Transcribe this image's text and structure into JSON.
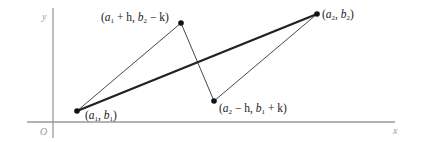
{
  "diagram": {
    "axes": {
      "origin_label": "O",
      "x_label": "x",
      "y_label": "y"
    },
    "points": [
      {
        "id": "p1",
        "name": "a",
        "sub": "1",
        "label_parts": [
          "(",
          "a",
          "1",
          ", ",
          "b",
          "1",
          ")"
        ],
        "x": 77,
        "y": 111
      },
      {
        "id": "p2",
        "label_parts": [
          "(",
          "a",
          "1",
          " + h, ",
          "b",
          "2",
          " − k)"
        ],
        "x": 181,
        "y": 23
      },
      {
        "id": "p3",
        "label_parts": [
          "(",
          "a",
          "2",
          ", ",
          "b",
          "2",
          ")"
        ],
        "x": 317,
        "y": 14
      },
      {
        "id": "p4",
        "label_parts": [
          "(",
          "a",
          "2",
          " − h, ",
          "b",
          "1",
          " + k)"
        ],
        "x": 214,
        "y": 101
      }
    ],
    "labels": {
      "p1": {
        "open": "(",
        "v1": "a",
        "s1": "1",
        "mid": ", ",
        "v2": "b",
        "s2": "1",
        "close": ")"
      },
      "p2": {
        "open": "(",
        "v1": "a",
        "s1": "1",
        "mid": " + h, ",
        "v2": "b",
        "s2": "2",
        "close": " − k)"
      },
      "p3": {
        "open": "(",
        "v1": "a",
        "s1": "2",
        "mid": ", ",
        "v2": "b",
        "s2": "2",
        "close": ")"
      },
      "p4": {
        "open": "(",
        "v1": "a",
        "s1": "2",
        "mid": " − h, ",
        "v2": "b",
        "s2": "1",
        "close": " + k)"
      }
    },
    "segments": [
      {
        "from": "p1",
        "to": "p3",
        "style": "thick"
      },
      {
        "from": "p1",
        "to": "p2",
        "style": "thin"
      },
      {
        "from": "p2",
        "to": "p4",
        "style": "thin"
      },
      {
        "from": "p4",
        "to": "p3",
        "style": "thin"
      }
    ]
  }
}
